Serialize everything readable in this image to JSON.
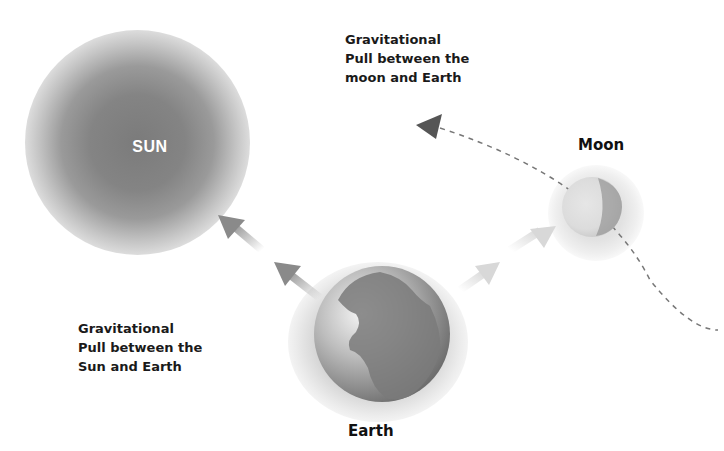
{
  "diagram": {
    "sun": {
      "label": "SUN"
    },
    "moon": {
      "label": "Moon"
    },
    "earth": {
      "label": "Earth"
    },
    "captions": {
      "moon_earth": "Gravitational\nPull between the\nmoon and Earth",
      "sun_earth": "Gravitational\nPull between the\nSun and Earth"
    },
    "arrows": [
      {
        "name": "earth-to-sun-pull",
        "from": "Earth",
        "to": "Sun",
        "count": 2
      },
      {
        "name": "earth-to-moon-pull",
        "from": "Earth",
        "to": "Moon",
        "count": 2
      },
      {
        "name": "moon-orbit-path",
        "style": "dashed",
        "direction": "counter-clockwise"
      }
    ],
    "colors": {
      "sun": "#7b7b7b",
      "arrow_sun": "#8a8a8a",
      "arrow_moon": "#d8d8d8",
      "orbit": "#777777",
      "orbit_arrowhead": "#555555",
      "text": "#1a1a1a"
    }
  }
}
